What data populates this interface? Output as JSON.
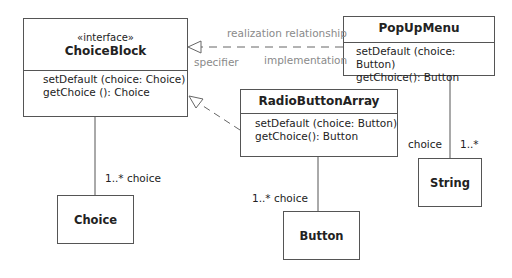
{
  "diagram": {
    "type": "UML class diagram",
    "classes": {
      "choice_block": {
        "stereotype": "«interface»",
        "name": "ChoiceBlock",
        "operations": [
          "setDefault (choice: Choice)",
          "getChoice (): Choice"
        ]
      },
      "pop_up_menu": {
        "name": "PopUpMenu",
        "operations": [
          "setDefault (choice: Button)",
          "getChoice(): Button"
        ]
      },
      "radio_button_array": {
        "name": "RadioButtonArray",
        "operations": [
          "setDefault (choice: Button)",
          "getChoice(): Button"
        ]
      },
      "choice": {
        "name": "Choice"
      },
      "button": {
        "name": "Button"
      },
      "string": {
        "name": "String"
      }
    },
    "labels": {
      "realization_relationship": "realization relationship",
      "specifier": "specifier",
      "implementation": "implementation",
      "choiceblock_choice": "1..* choice",
      "radio_choice": "1..* choice",
      "popup_role": "choice",
      "popup_mult": "1..*"
    },
    "colors": {
      "line": "#555555",
      "annotation_text": "#8a8a8a"
    }
  }
}
